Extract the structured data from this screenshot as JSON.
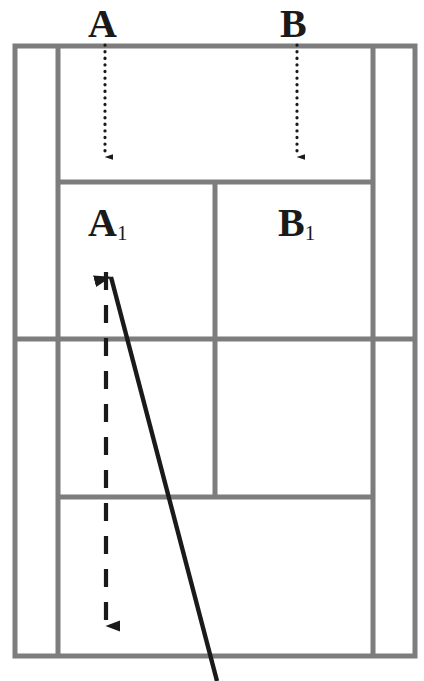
{
  "diagram": {
    "title": "",
    "kind": "tennis-court-plan",
    "colors": {
      "court_line": "#7d7d7d",
      "court_line_dark": "#6b6b6b",
      "label_text": "#1a1a1a",
      "trajectory": "#1a1a1a",
      "background": "#ffffff"
    },
    "labels": [
      {
        "id": "A",
        "base": "A",
        "sub": "",
        "x": 105,
        "y": 30
      },
      {
        "id": "B",
        "base": "B",
        "sub": "",
        "x": 297,
        "y": 30
      },
      {
        "id": "A1",
        "base": "A",
        "sub": "1",
        "x": 105,
        "y": 229
      },
      {
        "id": "B1",
        "base": "B",
        "sub": "1",
        "x": 297,
        "y": 229
      }
    ],
    "court": {
      "outer": {
        "x": 15,
        "y": 46,
        "width": 400,
        "height": 610
      },
      "singles_sideline_left_x": 58,
      "singles_sideline_right_x": 373,
      "net_y": 339,
      "service_line_top_y": 182,
      "service_line_bottom_y": 497,
      "center_service_line_x": 215,
      "line_width": 5
    },
    "arrows": [
      {
        "id": "arrow-A",
        "style": "dotted",
        "from_x": 105,
        "from_y": 45,
        "to_x": 105,
        "to_y": 166,
        "description": "dotted arrow from A down to service line"
      },
      {
        "id": "arrow-B",
        "style": "dotted",
        "from_x": 297,
        "from_y": 45,
        "to_x": 297,
        "to_y": 166,
        "description": "dotted arrow from B down to service line"
      },
      {
        "id": "arrow-dashed-down",
        "style": "dashed",
        "from_x": 106,
        "from_y": 272,
        "to_x": 106,
        "to_y": 641,
        "description": "dashed arrow running down the court from A1 area"
      },
      {
        "id": "arrow-solid-diagonal",
        "style": "solid",
        "from_x": 217,
        "from_y": 681,
        "to_x": 107,
        "to_y": 262,
        "description": "solid diagonal arrow from bottom right up to A1 area"
      }
    ]
  }
}
